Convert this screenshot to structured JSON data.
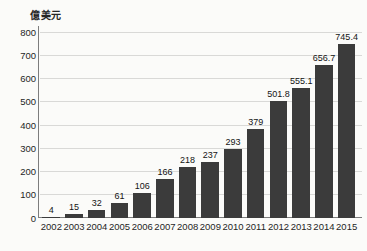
{
  "chart_data": {
    "type": "bar",
    "title": "",
    "subtitle": "",
    "xlabel": "",
    "ylabel": "億美元",
    "ylim": [
      0,
      800
    ],
    "yticks": [
      0,
      100,
      200,
      300,
      400,
      500,
      600,
      700,
      800
    ],
    "ytick_labels": [
      "0",
      "100",
      "200",
      "300",
      "400",
      "500",
      "600",
      "700",
      "800"
    ],
    "grid": true,
    "legend": null,
    "bar_color": "#3b3b3b",
    "background_color": "#fbfbf9",
    "gridline_color": "#d9d9d7",
    "axis_color": "#7d7d7d",
    "categories": [
      "2002",
      "2003",
      "2004",
      "2005",
      "2006",
      "2007",
      "2008",
      "2009",
      "2010",
      "2011",
      "2012",
      "2013",
      "2014",
      "2015"
    ],
    "values": [
      4,
      15,
      32,
      61,
      106,
      166,
      218,
      237,
      293,
      379,
      501.8,
      555.1,
      656.7,
      745.4
    ],
    "value_labels": [
      "4",
      "15",
      "32",
      "61",
      "106",
      "166",
      "218",
      "237",
      "293",
      "379",
      "501.8",
      "555.1",
      "656.7",
      "745.4"
    ],
    "series": [
      {
        "name": "",
        "values": [
          4,
          15,
          32,
          61,
          106,
          166,
          218,
          237,
          293,
          379,
          501.8,
          555.1,
          656.7,
          745.4
        ]
      }
    ]
  }
}
